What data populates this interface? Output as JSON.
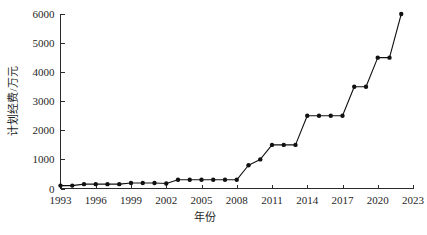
{
  "chart_data": {
    "type": "line",
    "title": "",
    "xlabel": "年份",
    "ylabel": "计划经费/万元",
    "xlim": [
      1993,
      2023
    ],
    "ylim": [
      0,
      6000
    ],
    "grid": false,
    "legend": false,
    "legend_position": "none",
    "marker": "filled-circle",
    "line_color": "#111111",
    "marker_color": "#111111",
    "x_tick_labels": [
      "1993",
      "1996",
      "1999",
      "2002",
      "2005",
      "2008",
      "2011",
      "2014",
      "2017",
      "2020",
      "2023"
    ],
    "x_tick_values": [
      1993,
      1996,
      1999,
      2002,
      2005,
      2008,
      2011,
      2014,
      2017,
      2020,
      2023
    ],
    "y_tick_labels": [
      "0",
      "1000",
      "2000",
      "3000",
      "4000",
      "5000",
      "6000"
    ],
    "y_tick_values": [
      0,
      1000,
      2000,
      3000,
      4000,
      5000,
      6000
    ],
    "x": [
      1993,
      1994,
      1995,
      1996,
      1997,
      1998,
      1999,
      2000,
      2001,
      2002,
      2003,
      2004,
      2005,
      2006,
      2007,
      2008,
      2009,
      2010,
      2011,
      2012,
      2013,
      2014,
      2015,
      2016,
      2017,
      2018,
      2019,
      2020,
      2021,
      2022
    ],
    "values": [
      100,
      100,
      150,
      150,
      150,
      150,
      190,
      190,
      190,
      170,
      300,
      300,
      300,
      300,
      300,
      300,
      800,
      1000,
      1500,
      1500,
      1500,
      2500,
      2500,
      2500,
      2500,
      3500,
      3500,
      4500,
      4500,
      6000
    ],
    "series": [
      {
        "name": "计划经费",
        "values": [
          100,
          100,
          150,
          150,
          150,
          150,
          190,
          190,
          190,
          170,
          300,
          300,
          300,
          300,
          300,
          300,
          800,
          1000,
          1500,
          1500,
          1500,
          2500,
          2500,
          2500,
          2500,
          3500,
          3500,
          4500,
          4500,
          6000
        ]
      }
    ]
  },
  "axes": {
    "y_title": "计划经费/万元",
    "x_title": "年份"
  }
}
